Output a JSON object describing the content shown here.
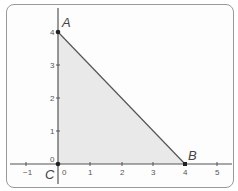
{
  "diagram": {
    "type": "coordinate-plane-triangle",
    "points": [
      {
        "label": "A",
        "x": 0,
        "y": 4
      },
      {
        "label": "B",
        "x": 4,
        "y": 0
      },
      {
        "label": "C",
        "x": 0,
        "y": 0
      }
    ],
    "x_ticks": [
      "−1",
      "0",
      "1",
      "2",
      "3",
      "4",
      "5"
    ],
    "y_ticks": [
      "0",
      "1",
      "2",
      "3",
      "4"
    ],
    "fill_color": "#e9e9e9",
    "line_color": "#555555"
  }
}
